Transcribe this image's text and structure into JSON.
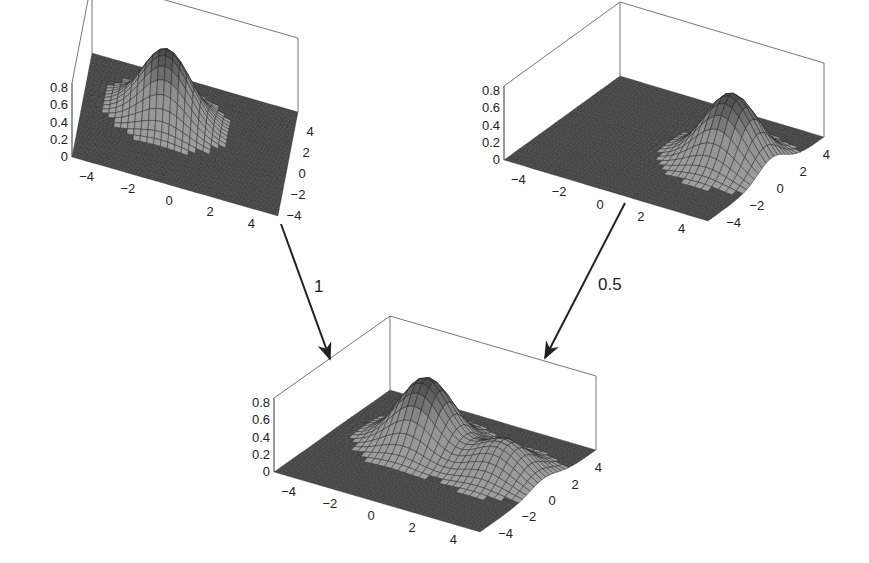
{
  "plots": [
    {
      "id": "top-left",
      "surface": {
        "peaks": [
          {
            "x": -1,
            "y": 1,
            "amp": 0.8,
            "sigma": 1.2
          }
        ]
      },
      "geometry": {
        "L": [
          72,
          157
        ],
        "F": [
          278,
          216
        ],
        "R": [
          298,
          112
        ],
        "zpx": 86,
        "zmax": 0.86
      },
      "z_ticks": [
        "0",
        "0.2",
        "0.4",
        "0.6",
        "0.8"
      ],
      "x_ticks": [
        "−4",
        "−2",
        "0",
        "2",
        "4"
      ],
      "y_ticks": [
        "−4",
        "−2",
        "0",
        "2",
        "4"
      ]
    },
    {
      "id": "top-right",
      "surface": {
        "peaks": [
          {
            "x": 3,
            "y": 0.5,
            "amp": 0.8,
            "sigma": 1.2
          }
        ]
      },
      "geometry": {
        "L": [
          504,
          160
        ],
        "F": [
          708,
          221
        ],
        "R": [
          824,
          137
        ],
        "zpx": 86,
        "zmax": 0.86
      },
      "z_ticks": [
        "0",
        "0.2",
        "0.4",
        "0.6",
        "0.8"
      ],
      "x_ticks": [
        "−4",
        "−2",
        "0",
        "2",
        "4"
      ],
      "y_ticks": [
        "−4",
        "−2",
        "0",
        "2",
        "4"
      ]
    },
    {
      "id": "bottom-sum",
      "surface": {
        "peaks": [
          {
            "x": -1,
            "y": 1,
            "amp": 0.8,
            "sigma": 1.2
          },
          {
            "x": 3,
            "y": 0.5,
            "amp": 0.4,
            "sigma": 1.2
          }
        ]
      },
      "geometry": {
        "L": [
          274,
          472
        ],
        "F": [
          480,
          532
        ],
        "R": [
          596,
          450
        ],
        "zpx": 86,
        "zmax": 0.86
      },
      "z_ticks": [
        "0",
        "0.2",
        "0.4",
        "0.6",
        "0.8"
      ],
      "x_ticks": [
        "−4",
        "−2",
        "0",
        "2",
        "4"
      ],
      "y_ticks": [
        "−4",
        "−2",
        "0",
        "2",
        "4"
      ]
    }
  ],
  "arrows": [
    {
      "id": "arrow-weight-1",
      "from": [
        281,
        224
      ],
      "to": [
        330,
        359
      ],
      "label": "1",
      "label_pos": [
        314,
        292
      ]
    },
    {
      "id": "arrow-weight-0.5",
      "from": [
        625,
        203
      ],
      "to": [
        545,
        358
      ],
      "label": "0.5",
      "label_pos": [
        598,
        290
      ]
    }
  ],
  "colors": {
    "floor": "#4a4a4a",
    "mesh": "#222222",
    "box": "#777777",
    "peak_low": "#9a9a9a",
    "peak_high": "#3a3a3a"
  }
}
